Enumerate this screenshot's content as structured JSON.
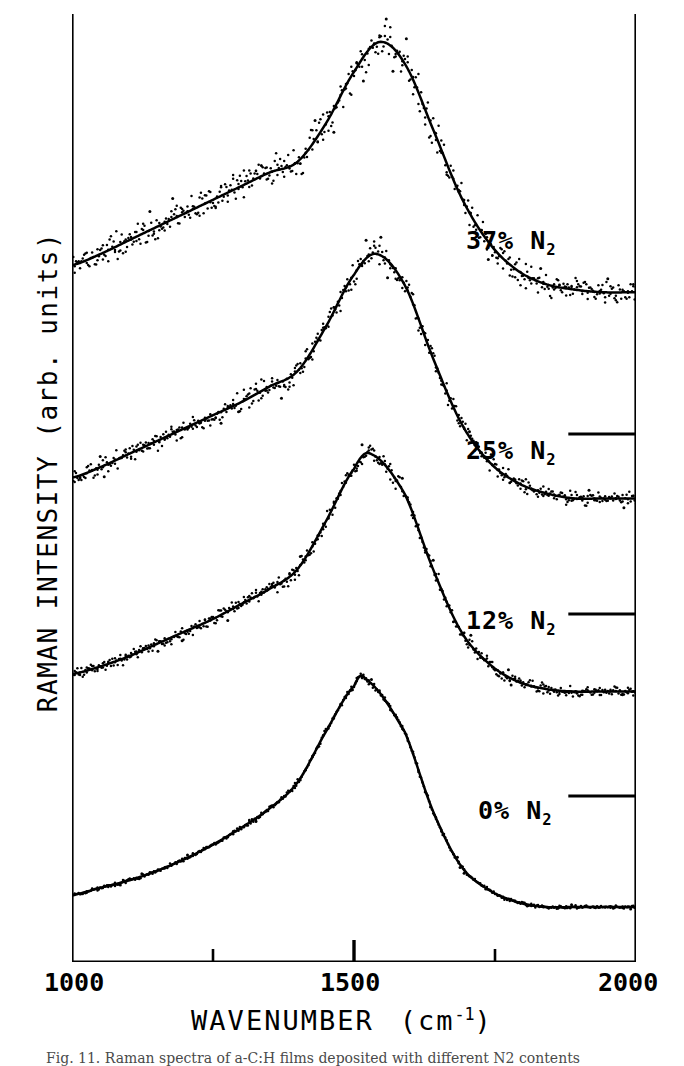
{
  "figure": {
    "ylabel": "RAMAN INTENSITY  (arb. units)",
    "xlabel_main": "WAVENUMBER",
    "xlabel_unit_open": "(cm",
    "xlabel_unit_exp": "-1",
    "xlabel_unit_close": ")",
    "caption": "Fig. 11.   Raman spectra of a-C:H films deposited with different N2 contents"
  },
  "axis": {
    "ticks": [
      {
        "name": "xtick-1000",
        "label": "1000",
        "value": 1000
      },
      {
        "name": "xtick-1500",
        "label": "1500",
        "value": 1500
      },
      {
        "name": "xtick-2000",
        "label": "2000",
        "value": 2000
      }
    ],
    "minor_ticks": [
      1250,
      1750
    ]
  },
  "curve_labels": [
    {
      "name": "curve-label-37",
      "percent": "37%",
      "species": "N",
      "sub": "2"
    },
    {
      "name": "curve-label-25",
      "percent": "25%",
      "species": "N",
      "sub": "2"
    },
    {
      "name": "curve-label-12",
      "percent": "12%",
      "species": "N",
      "sub": "2"
    },
    {
      "name": "curve-label-0",
      "percent": "0%",
      "species": "N",
      "sub": "2"
    }
  ],
  "colors": {
    "ink": "#000000",
    "paper": "#ffffff",
    "caption": "#4a4a4a"
  },
  "chart_data": {
    "type": "line",
    "title": "",
    "subtitle": "",
    "xlabel": "WAVENUMBER (cm^-1)",
    "ylabel": "RAMAN INTENSITY (arb. units)",
    "xlim": [
      1000,
      2000
    ],
    "ylim": [
      0,
      1
    ],
    "y_axis_note": "arbitrary units; traces are vertically offset, no numeric y ticks",
    "grid": false,
    "legend": "inline labels at right of each trace",
    "xticks": [
      1000,
      1500,
      2000
    ],
    "xminorticks": [
      1250,
      1750
    ],
    "annotations": [
      {
        "text": "37% N2",
        "x": 1780,
        "y_trace": "37% N2"
      },
      {
        "text": "25% N2",
        "x": 1780,
        "y_trace": "25% N2"
      },
      {
        "text": "12% N2",
        "x": 1780,
        "y_trace": "12% N2"
      },
      {
        "text": "0% N2",
        "x": 1780,
        "y_trace": "0% N2"
      }
    ],
    "baseline_markers": [
      {
        "x_start": 1880,
        "x_end": 2000,
        "trace_above": "25% N2"
      },
      {
        "x_start": 1880,
        "x_end": 2000,
        "trace_above": "12% N2"
      },
      {
        "x_start": 1880,
        "x_end": 2000,
        "trace_above": "0% N2"
      }
    ],
    "series": [
      {
        "name": "37% N2",
        "noise_level": 0.055,
        "peak_center": 1545,
        "peak_width": 175,
        "shoulder_center": 1360,
        "offset_index": 0,
        "x": [
          1000,
          1050,
          1100,
          1150,
          1200,
          1250,
          1300,
          1350,
          1400,
          1450,
          1500,
          1545,
          1590,
          1640,
          1690,
          1740,
          1790,
          1840,
          1890,
          1940,
          2000
        ],
        "values": [
          0.18,
          0.22,
          0.27,
          0.32,
          0.37,
          0.42,
          0.47,
          0.52,
          0.56,
          0.7,
          0.89,
          1.0,
          0.92,
          0.68,
          0.43,
          0.26,
          0.16,
          0.11,
          0.09,
          0.08,
          0.08
        ]
      },
      {
        "name": "25% N2",
        "noise_level": 0.04,
        "peak_center": 1540,
        "peak_width": 160,
        "shoulder_center": 1360,
        "offset_index": 1,
        "x": [
          1000,
          1050,
          1100,
          1150,
          1200,
          1250,
          1300,
          1350,
          1400,
          1450,
          1500,
          1540,
          1590,
          1640,
          1690,
          1740,
          1790,
          1840,
          1890,
          1940,
          2000
        ],
        "values": [
          0.14,
          0.18,
          0.23,
          0.28,
          0.33,
          0.38,
          0.43,
          0.49,
          0.55,
          0.72,
          0.92,
          1.0,
          0.88,
          0.6,
          0.35,
          0.2,
          0.12,
          0.08,
          0.06,
          0.06,
          0.06
        ]
      },
      {
        "name": "12% N2",
        "noise_level": 0.03,
        "peak_center": 1530,
        "peak_width": 150,
        "shoulder_center": 1355,
        "offset_index": 2,
        "x": [
          1000,
          1050,
          1100,
          1150,
          1200,
          1250,
          1300,
          1350,
          1400,
          1450,
          1500,
          1530,
          1590,
          1640,
          1690,
          1740,
          1790,
          1840,
          1890,
          1940,
          2000
        ],
        "values": [
          0.12,
          0.15,
          0.19,
          0.24,
          0.29,
          0.34,
          0.4,
          0.46,
          0.54,
          0.73,
          0.94,
          1.0,
          0.84,
          0.54,
          0.29,
          0.16,
          0.09,
          0.06,
          0.05,
          0.05,
          0.05
        ]
      },
      {
        "name": "0% N2",
        "noise_level": 0.01,
        "peak_center": 1520,
        "peak_width": 145,
        "shoulder_center": 1350,
        "offset_index": 3,
        "x": [
          1000,
          1050,
          1100,
          1150,
          1200,
          1250,
          1300,
          1350,
          1400,
          1450,
          1500,
          1520,
          1590,
          1640,
          1690,
          1740,
          1790,
          1840,
          1890,
          1940,
          2000
        ],
        "values": [
          0.1,
          0.13,
          0.16,
          0.2,
          0.25,
          0.31,
          0.38,
          0.46,
          0.57,
          0.78,
          0.97,
          1.0,
          0.78,
          0.45,
          0.22,
          0.12,
          0.07,
          0.05,
          0.05,
          0.05,
          0.05
        ]
      }
    ]
  }
}
